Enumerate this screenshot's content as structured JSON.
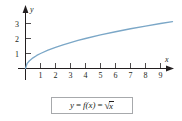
{
  "figure": {
    "name": "square-root-function-graph",
    "caption_formula": {
      "lhs": "y",
      "eq1": "=",
      "mid": "f(x)",
      "eq2": "=",
      "radical_sign": "√",
      "radicand": "x"
    },
    "caption_plain": "y = f(x) = √x"
  },
  "axes": {
    "x_axis_label": "x",
    "y_axis_label": "y",
    "x_ticks": [
      "1",
      "2",
      "3",
      "4",
      "5",
      "6",
      "7",
      "8",
      "9"
    ],
    "y_ticks": [
      "1",
      "2",
      "3"
    ],
    "axis_color": "#231f20"
  },
  "chart_data": {
    "type": "line",
    "title": "",
    "subtitle": "",
    "xlabel": "x",
    "ylabel": "y",
    "xlim": [
      0,
      10
    ],
    "ylim": [
      0,
      3.6
    ],
    "xticks": [
      1,
      2,
      3,
      4,
      5,
      6,
      7,
      8,
      9
    ],
    "yticks": [
      1,
      2,
      3
    ],
    "grid": false,
    "legend": false,
    "legend_position": "none",
    "annotations": [
      "y = f(x) = √x"
    ],
    "series": [
      {
        "name": "f(x) = sqrt(x)",
        "color": "#7ba7c7",
        "x": [
          0,
          0.1,
          0.25,
          0.5,
          0.75,
          1,
          1.5,
          2,
          2.5,
          3,
          3.5,
          4,
          5,
          6,
          7,
          8,
          9,
          9.8
        ],
        "values": [
          0,
          0.32,
          0.5,
          0.71,
          0.87,
          1,
          1.22,
          1.41,
          1.58,
          1.73,
          1.87,
          2,
          2.24,
          2.45,
          2.65,
          2.83,
          3,
          3.13
        ]
      }
    ]
  }
}
